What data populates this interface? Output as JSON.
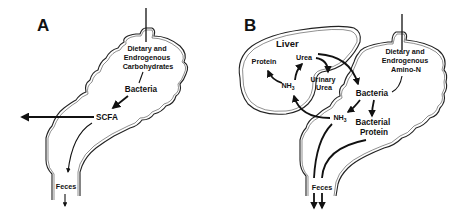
{
  "figure": {
    "panels": [
      {
        "id": "A",
        "label": "A",
        "source_label": [
          "Dietary and",
          "Endrogenous",
          "Carbohydrates"
        ],
        "nodes": {
          "bacteria": "Bacteria",
          "scfa": "SCFA",
          "feces": "Feces"
        },
        "flows": [
          {
            "from": "Dietary and Endrogenous Carbohydrates",
            "to": "Bacteria"
          },
          {
            "from": "Bacteria",
            "to": "SCFA"
          },
          {
            "from": "SCFA",
            "to": "absorbed (out of colon)"
          },
          {
            "from": "SCFA",
            "to": "Feces"
          }
        ]
      },
      {
        "id": "B",
        "label": "B",
        "organ_label": "Liver",
        "source_label": [
          "Dietary and",
          "Endrogenous",
          "Amino-N"
        ],
        "nodes": {
          "protein": "Protein",
          "urea": "Urea",
          "nh3_liver": "NH",
          "nh3_liver_sub": "3",
          "urinary_urea": [
            "Urinary",
            "Urea"
          ],
          "bacteria": "Bacteria",
          "nh3_colon": "NH",
          "nh3_colon_sub": "3",
          "bacterial_protein": [
            "Bacterial",
            "Protein"
          ],
          "feces": "Feces"
        },
        "flows": [
          {
            "from": "Dietary and Endrogenous Amino-N",
            "to": "Bacteria"
          },
          {
            "from": "Bacteria",
            "to": "NH3 (colon)"
          },
          {
            "from": "Bacteria",
            "to": "Bacterial Protein"
          },
          {
            "from": "NH3 (colon)",
            "to": "NH3 (liver)"
          },
          {
            "from": "NH3 (liver)",
            "to": "Protein"
          },
          {
            "from": "NH3 (liver)",
            "to": "Urea"
          },
          {
            "from": "Urea",
            "to": "Urinary Urea"
          },
          {
            "from": "Urea",
            "to": "Bacteria"
          },
          {
            "from": "NH3 (colon)",
            "to": "Feces"
          },
          {
            "from": "Bacterial Protein",
            "to": "Feces"
          }
        ]
      }
    ]
  }
}
